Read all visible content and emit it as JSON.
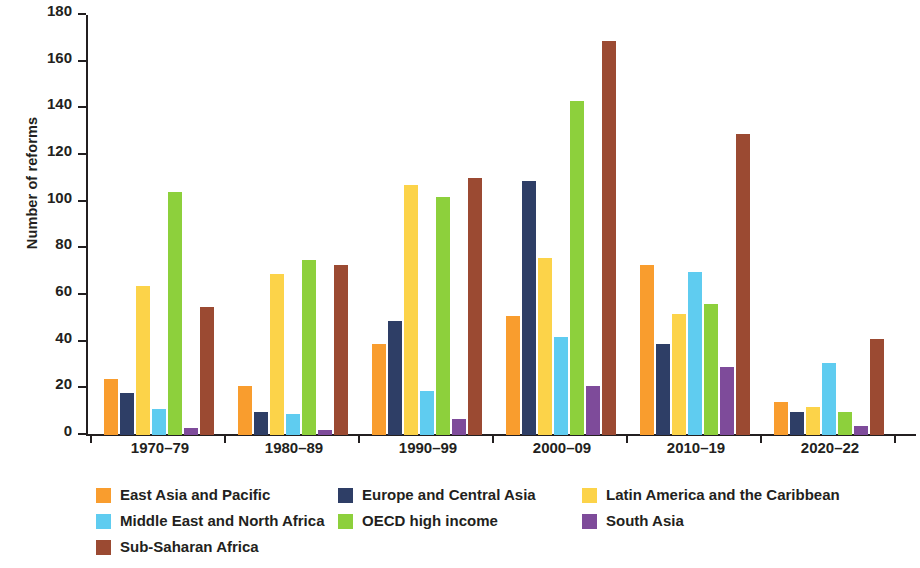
{
  "chart_data": {
    "type": "bar",
    "title": "",
    "xlabel": "",
    "ylabel": "Number of reforms",
    "ylim": [
      0,
      180
    ],
    "ytick_step": 20,
    "yticks": [
      0,
      20,
      40,
      60,
      80,
      100,
      120,
      140,
      160,
      180
    ],
    "grid": false,
    "legend_position": "bottom",
    "categories": [
      "1970–79",
      "1980–89",
      "1990–99",
      "2000–09",
      "2010–19",
      "2020–22"
    ],
    "series": [
      {
        "name": "East Asia and Pacific",
        "color": "#F99D2E",
        "values": [
          24,
          21,
          39,
          51,
          73,
          14
        ]
      },
      {
        "name": "Europe and Central Asia",
        "color": "#2E3E66",
        "values": [
          18,
          10,
          49,
          109,
          39,
          10
        ]
      },
      {
        "name": "Latin America and the Caribbean",
        "color": "#FCD349",
        "values": [
          64,
          69,
          107,
          76,
          52,
          12
        ]
      },
      {
        "name": "Middle East and North Africa",
        "color": "#5FCCF0",
        "values": [
          11,
          9,
          19,
          42,
          70,
          31
        ]
      },
      {
        "name": "OECD high income",
        "color": "#8DD03C",
        "values": [
          104,
          75,
          102,
          143,
          56,
          10
        ]
      },
      {
        "name": "South Asia",
        "color": "#7E4B9A",
        "values": [
          3,
          2,
          7,
          21,
          29,
          4
        ]
      },
      {
        "name": "Sub-Saharan Africa",
        "color": "#9B4A32",
        "values": [
          55,
          73,
          110,
          169,
          129,
          41
        ]
      }
    ]
  },
  "legend": {
    "rows": [
      [
        {
          "label": "East Asia and Pacific",
          "color": "#F99D2E",
          "width": 242
        },
        {
          "label": "Europe and Central Asia",
          "color": "#2E3E66",
          "width": 244
        },
        {
          "label": "Latin America and the Caribbean",
          "color": "#FCD349",
          "width": 290
        }
      ],
      [
        {
          "label": "Middle East and North Africa",
          "color": "#5FCCF0",
          "width": 242
        },
        {
          "label": "OECD high income",
          "color": "#8DD03C",
          "width": 244
        },
        {
          "label": "South Asia",
          "color": "#7E4B9A",
          "width": 290
        }
      ],
      [
        {
          "label": "Sub-Saharan Africa",
          "color": "#9B4A32",
          "width": 242
        }
      ]
    ]
  }
}
